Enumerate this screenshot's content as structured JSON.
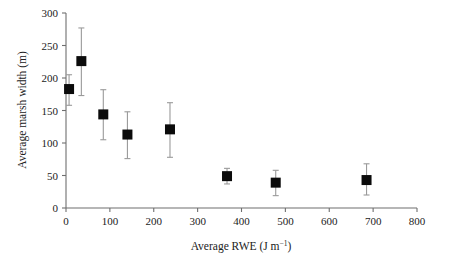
{
  "chart_data": {
    "type": "scatter",
    "title": "",
    "xlabel": "Average RWE (J m−1)",
    "xlabel_parts": {
      "base": "Average RWE (J m",
      "sup": "−1",
      "tail": ")"
    },
    "ylabel": "Average marsh width (m)",
    "xlim": [
      0,
      800
    ],
    "ylim": [
      0,
      300
    ],
    "xticks": [
      0,
      100,
      200,
      300,
      400,
      500,
      600,
      700,
      800
    ],
    "yticks": [
      0,
      50,
      100,
      150,
      200,
      250,
      300
    ],
    "xtick_labels": [
      "0",
      "100",
      "200",
      "300",
      "400",
      "500",
      "600",
      "700",
      "800"
    ],
    "ytick_labels": [
      "0",
      "50",
      "100",
      "150",
      "200",
      "250",
      "300"
    ],
    "grid": false,
    "legend": "none",
    "marker": "filled-square",
    "error_bars": "vertical",
    "series": [
      {
        "name": "Average marsh width vs Average RWE",
        "marker_color": "#0b0b0b",
        "error_color": "#9a9a9a",
        "points": [
          {
            "x": 7,
            "y": 183,
            "yerr_low": 158,
            "yerr_high": 205
          },
          {
            "x": 35,
            "y": 226,
            "yerr_low": 173,
            "yerr_high": 277
          },
          {
            "x": 85,
            "y": 144,
            "yerr_low": 105,
            "yerr_high": 182
          },
          {
            "x": 140,
            "y": 113,
            "yerr_low": 76,
            "yerr_high": 148
          },
          {
            "x": 237,
            "y": 121,
            "yerr_low": 78,
            "yerr_high": 162
          },
          {
            "x": 367,
            "y": 49,
            "yerr_low": 37,
            "yerr_high": 61
          },
          {
            "x": 478,
            "y": 39,
            "yerr_low": 19,
            "yerr_high": 58
          },
          {
            "x": 685,
            "y": 43,
            "yerr_low": 20,
            "yerr_high": 68
          }
        ]
      }
    ]
  },
  "colors": {
    "marker": "#0b0b0b",
    "error_bar": "#9a9a9a",
    "axis": "#6f6f6f",
    "text": "#222222",
    "background": "#ffffff"
  }
}
